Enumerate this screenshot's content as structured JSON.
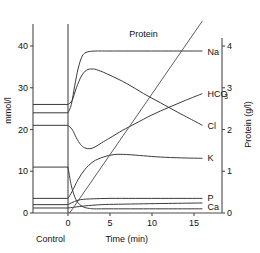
{
  "chart_data": {
    "type": "line",
    "title": "",
    "subtitle": "",
    "xlabel": "Time (min)",
    "ylabel": "mmol/l",
    "y2label": "Protein (g/l)",
    "xlim": [
      -4,
      16
    ],
    "ylim": [
      0,
      45
    ],
    "y2lim": [
      0,
      4.5
    ],
    "grid": false,
    "legend_position": "right-inline-labels",
    "xticks": [
      0,
      5,
      10,
      15
    ],
    "xticklabels": [
      "0",
      "5",
      "10",
      "15"
    ],
    "yticks": [
      0,
      10,
      20,
      30,
      40
    ],
    "yticklabels": [
      "0",
      "10",
      "20",
      "30",
      "40"
    ],
    "y2ticks": [
      0,
      1,
      2,
      3,
      4
    ],
    "y2ticklabels": [
      "0",
      "1",
      "2",
      "3",
      "4"
    ],
    "control_region_label": "Control",
    "annotations": [
      {
        "text": "Protein",
        "x": 9.0,
        "y": 43.0
      }
    ],
    "series": [
      {
        "name": "Na",
        "label": "Na",
        "axis": "left",
        "control_value": 24.0,
        "label_x": 16.6,
        "label_y": 38.6,
        "points": [
          [
            -4.0,
            24.0
          ],
          [
            0.0,
            24.0
          ],
          [
            0.4,
            26.0
          ],
          [
            0.8,
            30.5
          ],
          [
            1.2,
            34.5
          ],
          [
            1.6,
            37.2
          ],
          [
            2.0,
            38.3
          ],
          [
            2.6,
            38.7
          ],
          [
            3.5,
            38.8
          ],
          [
            5.0,
            38.8
          ],
          [
            8.0,
            38.8
          ],
          [
            12.0,
            38.8
          ],
          [
            16.0,
            38.8
          ]
        ]
      },
      {
        "name": "HCO3",
        "label": "HCO",
        "label_sub": "3",
        "axis": "left",
        "control_value": 21.0,
        "label_x": 16.6,
        "label_y": 28.6,
        "points": [
          [
            -4.0,
            21.0
          ],
          [
            0.0,
            21.0
          ],
          [
            0.5,
            20.0
          ],
          [
            1.0,
            18.0
          ],
          [
            1.5,
            16.4
          ],
          [
            2.0,
            15.6
          ],
          [
            2.6,
            15.4
          ],
          [
            3.2,
            15.8
          ],
          [
            4.0,
            16.8
          ],
          [
            5.0,
            18.0
          ],
          [
            6.5,
            19.8
          ],
          [
            8.0,
            21.4
          ],
          [
            10.0,
            23.5
          ],
          [
            12.0,
            25.3
          ],
          [
            14.0,
            27.0
          ],
          [
            16.0,
            28.6
          ]
        ]
      },
      {
        "name": "Cl",
        "label": "Cl",
        "axis": "left",
        "control_value": 26.0,
        "label_x": 16.6,
        "label_y": 21.0,
        "points": [
          [
            -4.0,
            26.0
          ],
          [
            0.0,
            26.0
          ],
          [
            0.5,
            27.0
          ],
          [
            1.0,
            30.0
          ],
          [
            1.6,
            32.8
          ],
          [
            2.2,
            34.2
          ],
          [
            2.9,
            34.5
          ],
          [
            3.6,
            34.2
          ],
          [
            5.0,
            33.0
          ],
          [
            7.0,
            31.0
          ],
          [
            9.0,
            28.6
          ],
          [
            11.0,
            26.4
          ],
          [
            13.0,
            24.2
          ],
          [
            14.5,
            22.6
          ],
          [
            16.0,
            21.0
          ]
        ]
      },
      {
        "name": "K",
        "label": "K",
        "axis": "left",
        "control_value": 11.0,
        "label_x": 16.6,
        "label_y": 13.2,
        "points": [
          [
            -4.0,
            11.0
          ],
          [
            0.0,
            11.0
          ],
          [
            0.4,
            6.5
          ],
          [
            0.9,
            3.4
          ],
          [
            1.4,
            2.0
          ],
          [
            2.0,
            1.3
          ],
          [
            2.6,
            1.1
          ],
          [
            3.0,
            1.0
          ],
          [
            4.0,
            1.0
          ],
          [
            6.0,
            1.0
          ],
          [
            9.0,
            1.0
          ],
          [
            12.0,
            1.0
          ],
          [
            16.0,
            1.0
          ]
        ]
      },
      {
        "name": "P",
        "label": "P",
        "axis": "left",
        "control_value": 3.5,
        "label_x": 16.6,
        "label_y": 3.6,
        "points": [
          [
            -4.0,
            3.5
          ],
          [
            0.0,
            3.5
          ],
          [
            0.5,
            5.2
          ],
          [
            1.2,
            8.0
          ],
          [
            2.0,
            10.4
          ],
          [
            3.0,
            12.3
          ],
          [
            4.2,
            13.4
          ],
          [
            5.5,
            14.0
          ],
          [
            7.0,
            14.0
          ],
          [
            9.0,
            13.7
          ],
          [
            11.0,
            13.4
          ],
          [
            13.5,
            13.2
          ],
          [
            16.0,
            13.1
          ]
        ]
      },
      {
        "name": "Ca",
        "label": "Ca",
        "axis": "left",
        "control_value": 1.2,
        "label_x": 16.6,
        "label_y": 1.5,
        "points": [
          [
            -4.0,
            1.2
          ],
          [
            0.0,
            1.2
          ],
          [
            0.8,
            1.4
          ],
          [
            2.0,
            1.7
          ],
          [
            4.0,
            2.0
          ],
          [
            6.0,
            2.1
          ],
          [
            9.0,
            2.2
          ],
          [
            12.0,
            2.3
          ],
          [
            16.0,
            2.4
          ]
        ]
      },
      {
        "name": "Protein",
        "label": "Protein",
        "axis": "right",
        "control_value": 0.0,
        "label_x": 9.0,
        "label_y": 43.0,
        "points": [
          [
            0.2,
            0.0
          ],
          [
            16.0,
            4.6
          ]
        ]
      },
      {
        "name": "P-secondary-rise",
        "label": "",
        "axis": "left",
        "control_value": 2.0,
        "label_x": 0,
        "label_y": 0,
        "points": [
          [
            -4.0,
            2.0
          ],
          [
            0.0,
            2.0
          ],
          [
            0.6,
            2.6
          ],
          [
            1.5,
            3.2
          ],
          [
            3.0,
            3.4
          ],
          [
            5.0,
            3.5
          ],
          [
            8.0,
            3.5
          ],
          [
            12.0,
            3.5
          ],
          [
            16.0,
            3.5
          ]
        ]
      }
    ]
  }
}
